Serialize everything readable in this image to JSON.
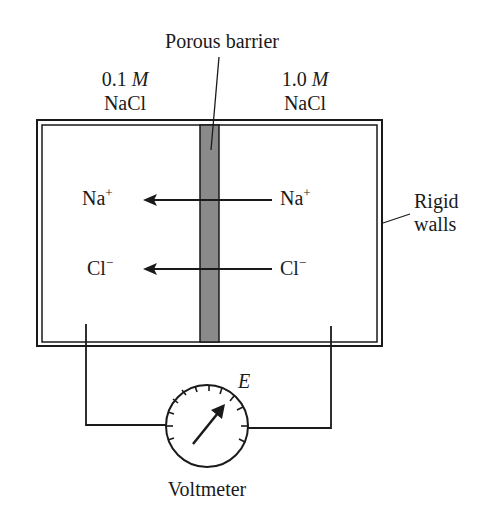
{
  "diagram": {
    "labels": {
      "barrier": "Porous barrier",
      "left_conc_value": "0.1",
      "left_conc_unit": "M",
      "left_solute": "NaCl",
      "right_conc_value": "1.0",
      "right_conc_unit": "M",
      "right_solute": "NaCl",
      "walls_line1": "Rigid",
      "walls_line2": "walls",
      "voltmeter": "Voltmeter",
      "emf_symbol": "E"
    },
    "ions": [
      {
        "symbol": "Na",
        "charge": "+",
        "direction": "right-to-left"
      },
      {
        "symbol": "Cl",
        "charge": "−",
        "direction": "right-to-left"
      }
    ],
    "colors": {
      "line": "#1a1a1a",
      "barrier_fill": "#8a8a8a",
      "background": "#ffffff"
    }
  }
}
